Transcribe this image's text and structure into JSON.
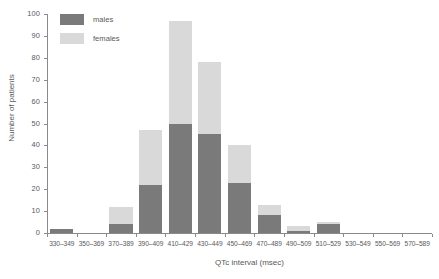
{
  "chart_data": {
    "type": "bar",
    "subtype": "stacked-histogram",
    "title": "",
    "xlabel": "QTc interval (msec)",
    "ylabel": "Number of patients",
    "ylim": [
      0,
      100
    ],
    "ytick_step": 10,
    "yticks": [
      0,
      10,
      20,
      30,
      40,
      50,
      60,
      70,
      80,
      90,
      100
    ],
    "grid": false,
    "legend_position": "top-left",
    "categories": [
      "330–349",
      "350–369",
      "370–389",
      "390–409",
      "410–429",
      "430–449",
      "450–469",
      "470–489",
      "490–509",
      "510–529",
      "530–549",
      "550–569",
      "570–589"
    ],
    "series": [
      {
        "name": "males",
        "color": "#7a7a7a",
        "values": [
          2,
          0,
          4,
          22,
          50,
          45,
          23,
          8,
          1,
          4,
          0,
          0,
          0
        ]
      },
      {
        "name": "females",
        "color": "#d9d9d9",
        "values": [
          0,
          0,
          8,
          25,
          47,
          33,
          17,
          5,
          2,
          1,
          0,
          0,
          0
        ]
      }
    ],
    "totals": [
      2,
      0,
      12,
      47,
      97,
      78,
      40,
      13,
      3,
      5,
      0,
      0,
      0
    ]
  },
  "legend": {
    "items": [
      {
        "label": "males",
        "color": "#7a7a7a"
      },
      {
        "label": "females",
        "color": "#d9d9d9"
      }
    ]
  },
  "axes": {
    "y_title": "Number of patients",
    "x_title": "QTc interval (msec)",
    "y_tick_labels": [
      "0",
      "10",
      "20",
      "30",
      "40",
      "50",
      "60",
      "70",
      "80",
      "90",
      "100"
    ]
  }
}
